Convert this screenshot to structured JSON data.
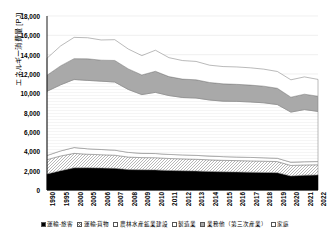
{
  "chart_data": {
    "type": "area",
    "stacked": true,
    "title": "",
    "xlabel": "",
    "ylabel": "エネルギー消費量 [PJ]",
    "ylim": [
      0,
      18000
    ],
    "ytick_step": 2000,
    "ytick_labels": [
      "18,000",
      "16,000",
      "14,000",
      "12,000",
      "10,000",
      "8,000",
      "6,000",
      "4,000",
      "2,000",
      "0"
    ],
    "grid": true,
    "legend_position": "bottom",
    "categories": [
      "1990",
      "1995",
      "2000",
      "2005",
      "2006",
      "2007",
      "2008",
      "2009",
      "2010",
      "2011",
      "2012",
      "2013",
      "2014",
      "2015",
      "2016",
      "2017",
      "2018",
      "2019",
      "2020",
      "2021",
      "2022"
    ],
    "series": [
      {
        "name": "運輸-旅客",
        "fill": "#000000",
        "pattern": "solid",
        "values": [
          1660,
          2000,
          2290,
          2300,
          2270,
          2240,
          2110,
          2090,
          2080,
          2020,
          1990,
          1960,
          1920,
          1880,
          1860,
          1840,
          1820,
          1790,
          1450,
          1530,
          1560
        ]
      },
      {
        "name": "運輸-貨物",
        "fill": "#d8d8d8",
        "pattern": "hatch",
        "values": [
          1480,
          1520,
          1500,
          1400,
          1380,
          1360,
          1300,
          1260,
          1260,
          1240,
          1230,
          1220,
          1200,
          1190,
          1180,
          1170,
          1160,
          1150,
          1090,
          1060,
          1050
        ]
      },
      {
        "name": "農林水産鉱業建設",
        "fill": "#ffffff",
        "pattern": "solid",
        "values": [
          430,
          520,
          600,
          560,
          540,
          520,
          480,
          440,
          430,
          420,
          410,
          400,
          390,
          380,
          370,
          360,
          350,
          340,
          330,
          330,
          330
        ]
      },
      {
        "name": "製造業",
        "fill": "#fbfbfb",
        "pattern": "solid",
        "values": [
          6640,
          6840,
          7050,
          7080,
          7070,
          7050,
          6510,
          6080,
          6330,
          6090,
          5940,
          5940,
          5800,
          5740,
          5760,
          5740,
          5690,
          5560,
          5190,
          5400,
          5190
        ]
      },
      {
        "name": "業務他（第三次産業）",
        "fill": "#a9a9a9",
        "pattern": "solid",
        "values": [
          1660,
          1960,
          2150,
          2230,
          2170,
          2230,
          2130,
          2030,
          2180,
          1960,
          1900,
          1880,
          1810,
          1790,
          1760,
          1740,
          1720,
          1680,
          1540,
          1590,
          1570
        ]
      },
      {
        "name": "家庭",
        "fill": "#ffffff",
        "pattern": "solid",
        "values": [
          1760,
          2060,
          2200,
          2180,
          2090,
          2150,
          2050,
          2000,
          2180,
          1960,
          1920,
          1900,
          1790,
          1790,
          1800,
          1790,
          1760,
          1740,
          1800,
          1790,
          1740
        ]
      }
    ]
  },
  "legend": {
    "items": [
      {
        "label": "運輸-旅客",
        "swatch": "black-solid-swatch"
      },
      {
        "label": "運輸-貨物",
        "swatch": "hatched-swatch"
      },
      {
        "label": "農林水産鉱業建設",
        "swatch": "white-swatch"
      },
      {
        "label": "製造業",
        "swatch": "white-swatch"
      },
      {
        "label": "業務他（第三次産業）",
        "swatch": "gray-swatch"
      },
      {
        "label": "家庭",
        "swatch": "white-swatch"
      }
    ]
  },
  "colors": {
    "passenger_transport": "#000000",
    "freight_transport": "#d8d8d8",
    "primary_industry": "#ffffff",
    "manufacturing": "#fbfbfb",
    "commercial": "#a9a9a9",
    "household": "#ffffff",
    "axis": "#000000",
    "grid": "#e6e6e6"
  }
}
